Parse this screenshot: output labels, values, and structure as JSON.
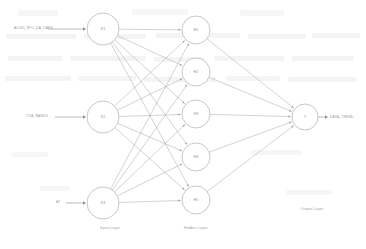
{
  "diagram": {
    "layers": {
      "input": {
        "caption": "Input Layer",
        "nodes": [
          {
            "id": "X1",
            "label": "X1",
            "cx": 103,
            "cy": 29,
            "r": 16
          },
          {
            "id": "X2",
            "label": "X2",
            "cx": 103,
            "cy": 117,
            "r": 16
          },
          {
            "id": "X3",
            "label": "X3",
            "cx": 103,
            "cy": 203,
            "r": 16
          }
        ],
        "caption_x": 110,
        "caption_y": 228
      },
      "hidden": {
        "caption": "Hidden Layer",
        "nodes": [
          {
            "id": "H1",
            "label": "H1",
            "cx": 196,
            "cy": 30,
            "r": 14
          },
          {
            "id": "H2",
            "label": "H2",
            "cx": 196,
            "cy": 72,
            "r": 14
          },
          {
            "id": "H3",
            "label": "H3",
            "cx": 196,
            "cy": 114,
            "r": 14
          },
          {
            "id": "H4",
            "label": "H4",
            "cx": 196,
            "cy": 157,
            "r": 14
          },
          {
            "id": "H5",
            "label": "H5",
            "cx": 196,
            "cy": 200,
            "r": 14
          }
        ],
        "caption_x": 196,
        "caption_y": 228
      },
      "output": {
        "caption": "Output Layer",
        "nodes": [
          {
            "id": "Y",
            "label": "Y",
            "cx": 305,
            "cy": 117,
            "r": 13
          }
        ],
        "caption_x": 312,
        "caption_y": 209
      }
    },
    "inputs": [
      {
        "label": "ALUVI_SPC_DA_DARK",
        "x": 14,
        "y": 28,
        "arrow_from": 48,
        "arrow_to": 86,
        "arrow_y": 29
      },
      {
        "label": "TOA_BANDS",
        "x": 26,
        "y": 116,
        "arrow_from": 55,
        "arrow_to": 86,
        "arrow_y": 117
      },
      {
        "label": "AT",
        "x": 56,
        "y": 202,
        "arrow_from": 66,
        "arrow_to": 86,
        "arrow_y": 203
      }
    ],
    "outputs": [
      {
        "label": "DATA_TREND",
        "x": 330,
        "y": 117,
        "arrow_from": 318,
        "arrow_to": 328,
        "arrow_y": 117
      }
    ],
    "colors": {
      "node_stroke": "#b9b9bd",
      "node_fill": "#ffffff",
      "edge": "#9d9da3",
      "text": "#8a8a90",
      "background": "#ffffff"
    }
  }
}
